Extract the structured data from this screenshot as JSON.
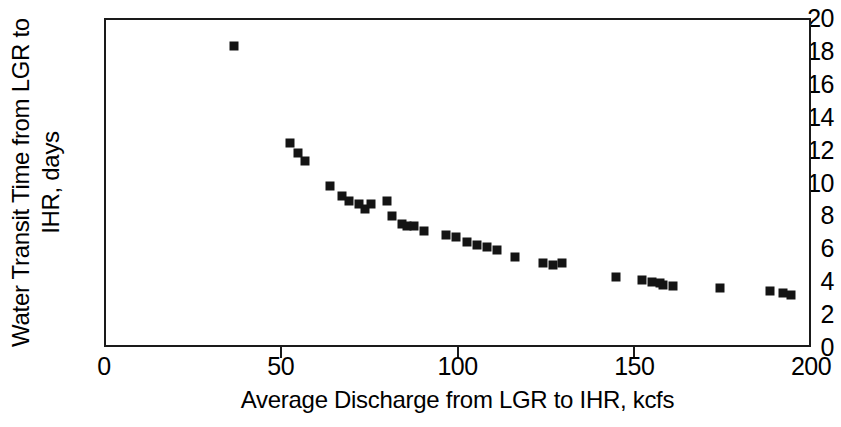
{
  "chart_data": {
    "type": "scatter",
    "title": "",
    "xlabel": "Average Discharge from LGR to IHR, kcfs",
    "ylabel_line1": "Water Transit Time from LGR to",
    "ylabel_line2": "IHR, days",
    "ylabel": "Water Transit Time from LGR to IHR, days",
    "xlim": [
      0,
      200
    ],
    "ylim": [
      0,
      20
    ],
    "xticks": [
      0,
      50,
      100,
      150,
      200
    ],
    "yticks": [
      0,
      2,
      4,
      6,
      8,
      10,
      12,
      14,
      16,
      18,
      20
    ],
    "xtick_labels": [
      "0",
      "50",
      "100",
      "150",
      "200"
    ],
    "ytick_labels": [
      "0",
      "2",
      "4",
      "6",
      "8",
      "10",
      "12",
      "14",
      "16",
      "18",
      "20"
    ],
    "grid": false,
    "legend": false,
    "marker": "filled-square",
    "marker_color": "#141414",
    "series": [
      {
        "name": "Water transit time vs average discharge",
        "points": [
          [
            36.2,
            18.4
          ],
          [
            52.0,
            12.5
          ],
          [
            54.3,
            11.9
          ],
          [
            56.3,
            11.4
          ],
          [
            63.4,
            9.9
          ],
          [
            66.8,
            9.3
          ],
          [
            68.8,
            9.0
          ],
          [
            71.6,
            8.8
          ],
          [
            73.3,
            8.5
          ],
          [
            75.0,
            8.8
          ],
          [
            79.4,
            9.0
          ],
          [
            80.8,
            8.1
          ],
          [
            83.7,
            7.6
          ],
          [
            85.1,
            7.5
          ],
          [
            87.1,
            7.5
          ],
          [
            90.0,
            7.2
          ],
          [
            96.2,
            6.9
          ],
          [
            99.0,
            6.8
          ],
          [
            102.1,
            6.5
          ],
          [
            104.9,
            6.3
          ],
          [
            107.7,
            6.2
          ],
          [
            110.6,
            6.0
          ],
          [
            115.7,
            5.6
          ],
          [
            123.6,
            5.2
          ],
          [
            126.4,
            5.1
          ],
          [
            129.0,
            5.2
          ],
          [
            144.3,
            4.4
          ],
          [
            151.6,
            4.2
          ],
          [
            154.5,
            4.1
          ],
          [
            156.7,
            4.0
          ],
          [
            157.7,
            3.9
          ],
          [
            160.5,
            3.8
          ],
          [
            173.7,
            3.7
          ],
          [
            187.8,
            3.5
          ],
          [
            191.5,
            3.4
          ],
          [
            193.8,
            3.3
          ]
        ]
      }
    ]
  }
}
